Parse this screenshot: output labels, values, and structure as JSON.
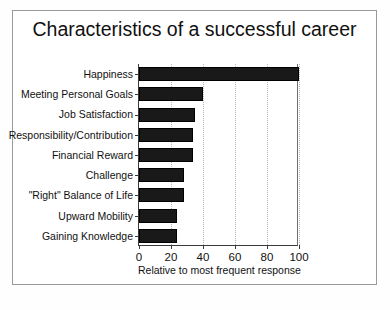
{
  "chart_data": {
    "type": "bar",
    "orientation": "horizontal",
    "title": "Characteristics of a successful career",
    "xlabel": "Relative to most frequent response",
    "ylabel": "",
    "categories": [
      "Happiness",
      "Meeting Personal Goals",
      "Job Satisfaction",
      "Responsibility/Contribution",
      "Financial Reward",
      "Challenge",
      "\"Right\" Balance of Life",
      "Upward Mobility",
      "Gaining Knowledge"
    ],
    "values": [
      100,
      40,
      35,
      34,
      34,
      28,
      28,
      24,
      24
    ],
    "xlim": [
      0,
      100
    ],
    "xticks": [
      0,
      20,
      40,
      60,
      80,
      100
    ],
    "xticklabels": [
      "0",
      "20",
      "40",
      "60",
      "80",
      "100"
    ],
    "gridlines": [
      20,
      40,
      60,
      80,
      100
    ],
    "grid": true,
    "legend": null,
    "bar_color": "#191919",
    "background_color": "#ffffff",
    "frame_color": "#9a9a9a"
  }
}
